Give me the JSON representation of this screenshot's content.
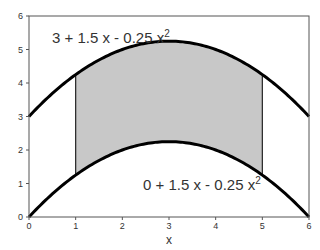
{
  "chart_data": {
    "type": "area",
    "title": "",
    "xlabel": "x",
    "ylabel": "",
    "xlim": [
      0,
      6
    ],
    "ylim": [
      0,
      6
    ],
    "xticks": [
      0,
      1,
      2,
      3,
      4,
      5,
      6
    ],
    "yticks": [
      0,
      1,
      2,
      3,
      4,
      5,
      6
    ],
    "grid": false,
    "legend": "none",
    "series": [
      {
        "name": "3 + 1.5 x - 0.25 x^2",
        "label_text": "3 + 1.5 x - 0.25 x",
        "label_sup": "2",
        "a": 3,
        "b": 1.5,
        "c": -0.25,
        "x": [
          0,
          1,
          2,
          3,
          4,
          5,
          6
        ],
        "values": [
          3,
          4.25,
          5,
          5.25,
          5,
          4.25,
          3
        ]
      },
      {
        "name": "0 + 1.5 x - 0.25 x^2",
        "label_text": "0 + 1.5 x - 0.25 x",
        "label_sup": "2",
        "a": 0,
        "b": 1.5,
        "c": -0.25,
        "x": [
          0,
          1,
          2,
          3,
          4,
          5,
          6
        ],
        "values": [
          0,
          1.25,
          2,
          2.25,
          2,
          1.25,
          0
        ]
      }
    ],
    "shaded_region": {
      "between": [
        "3 + 1.5 x - 0.25 x^2",
        "0 + 1.5 x - 0.25 x^2"
      ],
      "x_from": 1,
      "x_to": 5,
      "fill": "#c8c8c8"
    },
    "colors": {
      "curve": "#000000",
      "axis": "#555555",
      "shade": "#c8c8c8",
      "text": "#333333"
    }
  }
}
